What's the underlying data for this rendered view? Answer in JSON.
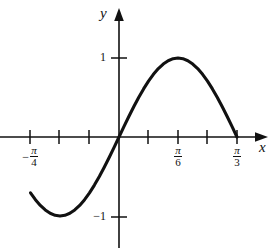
{
  "figure": {
    "background_color": "#ffffff",
    "ink_color": "#111111"
  },
  "axes": {
    "x_axis_label": "x",
    "y_axis_label": "y",
    "x_axis_arrow": "arrow-right",
    "y_axis_arrow": "arrow-up"
  },
  "labels": {
    "y_one": "1",
    "y_neg_one": "−1",
    "neg_sign": "−",
    "pi": "π",
    "four": "4",
    "six": "6",
    "three": "3"
  },
  "chart_data": {
    "type": "line",
    "title": "",
    "xlabel": "x",
    "ylabel": "y",
    "function": "y = sin(3x)",
    "grid": false,
    "legend": null,
    "xlim": [
      -0.9948,
      1.3265
    ],
    "ylim": [
      -1.45,
      1.55
    ],
    "x_ticks": [
      {
        "value": -0.7854,
        "label": "-π/4",
        "label_shown": true
      },
      {
        "value": -0.5236,
        "label": "-π/6",
        "label_shown": false
      },
      {
        "value": -0.2618,
        "label": "-π/12",
        "label_shown": false
      },
      {
        "value": 0.2618,
        "label": "π/12",
        "label_shown": false
      },
      {
        "value": 0.5236,
        "label": "π/6",
        "label_shown": true
      },
      {
        "value": 0.7854,
        "label": "π/4",
        "label_shown": false
      },
      {
        "value": 1.0472,
        "label": "π/3",
        "label_shown": true
      }
    ],
    "y_ticks": [
      {
        "value": 1,
        "label": "1",
        "label_shown": true
      },
      {
        "value": -1,
        "label": "−1",
        "label_shown": true
      }
    ],
    "domain": [
      -0.7854,
      1.0472
    ],
    "key_points": [
      {
        "x": -0.7854,
        "y": -0.7071,
        "note": "left endpoint"
      },
      {
        "x": -0.5236,
        "y": -1,
        "note": "minimum"
      },
      {
        "x": 0,
        "y": 0,
        "note": "zero crossing at origin"
      },
      {
        "x": 0.5236,
        "y": 1,
        "note": "maximum at pi/6"
      },
      {
        "x": 1.0472,
        "y": 0,
        "note": "right endpoint at pi/3"
      }
    ],
    "x": [
      -0.7854,
      -0.7418,
      -0.6981,
      -0.6545,
      -0.6109,
      -0.5672,
      -0.5236,
      -0.48,
      -0.4363,
      -0.3927,
      -0.3491,
      -0.3054,
      -0.2618,
      -0.2182,
      -0.1745,
      -0.1309,
      -0.0873,
      -0.0436,
      0,
      0.0436,
      0.0873,
      0.1309,
      0.1745,
      0.2182,
      0.2618,
      0.3054,
      0.3491,
      0.3927,
      0.4363,
      0.48,
      0.5236,
      0.5672,
      0.6109,
      0.6545,
      0.6981,
      0.7418,
      0.7854,
      0.829,
      0.8727,
      0.9163,
      0.9599,
      1.0036,
      1.0472
    ],
    "y": [
      -0.7071,
      -0.7934,
      -0.866,
      -0.9239,
      -0.9659,
      -0.9914,
      -1,
      -0.9914,
      -0.9659,
      -0.9239,
      -0.866,
      -0.7934,
      -0.7071,
      -0.6088,
      -0.5,
      -0.3827,
      -0.2588,
      -0.1305,
      0,
      0.1305,
      0.2588,
      0.3827,
      0.5,
      0.6088,
      0.7071,
      0.7934,
      0.866,
      0.9239,
      0.9659,
      0.9914,
      1,
      0.9914,
      0.9659,
      0.9239,
      0.866,
      0.7934,
      0.7071,
      0.6088,
      0.5,
      0.3827,
      0.2588,
      0.1305,
      0
    ]
  }
}
